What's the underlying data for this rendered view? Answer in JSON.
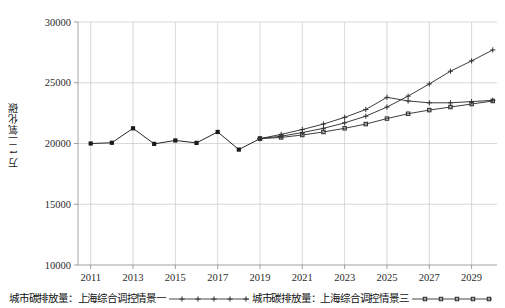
{
  "chart_data": {
    "type": "line",
    "title": "",
    "xlabel": "",
    "ylabel": "万 t 二氧化碳",
    "x": [
      2011,
      2012,
      2013,
      2014,
      2015,
      2016,
      2017,
      2018,
      2019,
      2020,
      2021,
      2022,
      2023,
      2024,
      2025,
      2026,
      2027,
      2028,
      2029,
      2030
    ],
    "xlim": [
      2010.4,
      2030.2
    ],
    "ylim": [
      10000,
      30000
    ],
    "xticks": [
      2011,
      2013,
      2015,
      2017,
      2019,
      2021,
      2023,
      2025,
      2027,
      2029
    ],
    "xticklabels": [
      "2011",
      "2013",
      "2015",
      "2017",
      "2019",
      "2021",
      "2023",
      "2025",
      "2027",
      "2029"
    ],
    "yticks": [
      10000,
      15000,
      20000,
      25000,
      30000
    ],
    "yticklabels": [
      "10000",
      "15000",
      "20000",
      "25000",
      "30000"
    ],
    "grid": true,
    "grid_color": "#c8c8c8",
    "legend_position": "bottom",
    "series": [
      {
        "name": "历史排放量",
        "marker": "square",
        "color": "#1a1a1a",
        "x": [
          2011,
          2012,
          2013,
          2014,
          2015,
          2016,
          2017,
          2018,
          2019
        ],
        "values": [
          20000,
          20060,
          21250,
          19970,
          20250,
          20050,
          20950,
          19500,
          20400
        ]
      },
      {
        "name": "城市碳排放量：上海综合调控情景一",
        "marker": "plus",
        "color": "#333333",
        "x": [
          2019,
          2020,
          2021,
          2022,
          2023,
          2024,
          2025,
          2026,
          2027,
          2028,
          2029,
          2030
        ],
        "values": [
          20400,
          20750,
          21150,
          21600,
          22150,
          22800,
          23800,
          23500,
          23350,
          23350,
          23450,
          23550
        ]
      },
      {
        "name": "城市碳排放量：上海综合调控情景二",
        "marker": "plus",
        "color": "#333333",
        "x": [
          2019,
          2020,
          2021,
          2022,
          2023,
          2024,
          2025,
          2026,
          2027,
          2028,
          2029,
          2030
        ],
        "values": [
          20400,
          20600,
          20900,
          21250,
          21700,
          22250,
          23000,
          23900,
          24900,
          25950,
          26800,
          27700
        ]
      },
      {
        "name": "城市碳排放量：上海综合调控情景三",
        "marker": "square-small",
        "color": "#333333",
        "x": [
          2019,
          2020,
          2021,
          2022,
          2023,
          2024,
          2025,
          2026,
          2027,
          2028,
          2029,
          2030
        ],
        "values": [
          20400,
          20500,
          20700,
          20950,
          21250,
          21600,
          22050,
          22450,
          22750,
          23000,
          23250,
          23500
        ]
      }
    ]
  },
  "legend": {
    "entry1": "城市碳排放量：上海综合调控情景一",
    "entry2": "城市碳排放量：上海综合调控情景三"
  }
}
